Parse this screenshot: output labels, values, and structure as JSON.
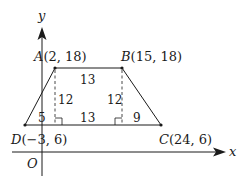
{
  "diagram": {
    "type": "trapezoid-on-coordinate-plane",
    "axes": {
      "x_label": "x",
      "y_label": "y",
      "origin_label": "O"
    },
    "points": {
      "A": {
        "name": "A",
        "coords": "(2, 18)"
      },
      "B": {
        "name": "B",
        "coords": "(15, 18)"
      },
      "C": {
        "name": "C",
        "coords": "(24, 6)"
      },
      "D": {
        "name": "D",
        "coords": "(−3, 6)"
      }
    },
    "measurements": {
      "top_AB": "13",
      "height_left": "12",
      "height_right": "12",
      "bottom_left_segment": "5",
      "bottom_middle_segment": "13",
      "bottom_right_segment": "9"
    }
  },
  "colors": {
    "ink": "#1a1a1a",
    "background": "#ffffff"
  }
}
